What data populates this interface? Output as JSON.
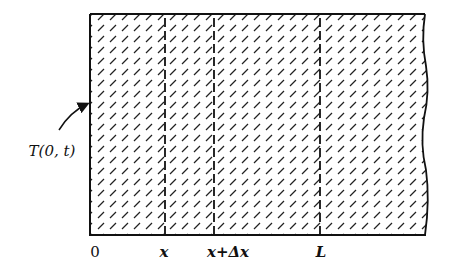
{
  "diagram": {
    "type": "rod-cross-section",
    "colors": {
      "ink": "#111111",
      "background": "#ffffff"
    },
    "boundary_label": "T(0, t)",
    "axis_labels": [
      {
        "id": "origin",
        "text": "0",
        "x": 95
      },
      {
        "id": "x",
        "text": "x",
        "x": 165
      },
      {
        "id": "x-plus-dx",
        "text": "x+Δx",
        "x": 214
      },
      {
        "id": "L",
        "text": "L",
        "x": 321
      }
    ],
    "dashed_lines_x": [
      165,
      214,
      320
    ]
  }
}
